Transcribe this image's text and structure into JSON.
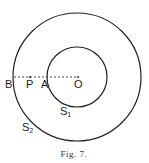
{
  "figure": {
    "caption": "Fig. 7.",
    "outer_circle": {
      "label": "S",
      "subscript": "2",
      "cx": 77,
      "cy": 77,
      "r": 64
    },
    "inner_circle": {
      "label": "S",
      "subscript": "1",
      "cx": 77,
      "cy": 77,
      "r": 30
    },
    "line": {
      "style": "dashed",
      "from": "B",
      "to": "O"
    },
    "points": {
      "B": "B",
      "P": "P",
      "A": "A",
      "O": "O"
    },
    "colors": {
      "stroke": "#222222",
      "background": "#ffffff"
    }
  }
}
